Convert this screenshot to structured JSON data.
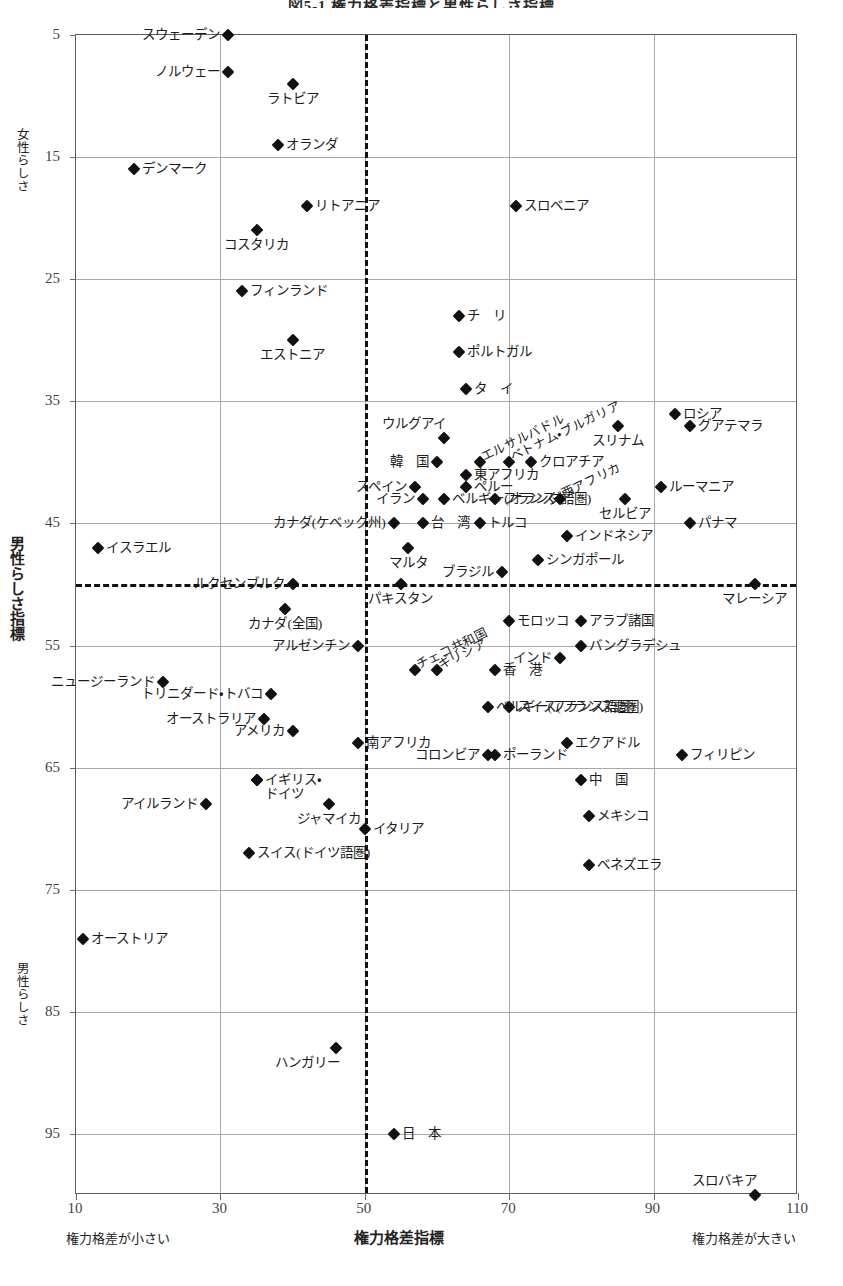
{
  "title": "図5-1 権力格差指標と男性らしさ指標",
  "axes": {
    "y_caption_top": "女性らしさ",
    "y_caption_main": "男性らしさ指標",
    "y_caption_bottom": "男性らしさ",
    "x_caption_left": "権力格差が小さい",
    "x_caption_center": "権力格差指標",
    "x_caption_right": "権力格差が大きい",
    "x_ticks": [
      10,
      30,
      50,
      70,
      90,
      110
    ],
    "y_ticks": [
      5,
      15,
      25,
      35,
      45,
      55,
      65,
      75,
      85,
      95
    ]
  },
  "chart_data": {
    "type": "scatter",
    "title": "図5-1 権力格差指標と男性らしさ指標",
    "xlabel": "権力格差指標",
    "ylabel": "男性らしさ指標",
    "xlim": [
      10,
      110
    ],
    "ylim": [
      5,
      100
    ],
    "y_inverted": true,
    "grid": true,
    "legend": "none",
    "reference_lines": {
      "x": 50,
      "y": 50
    },
    "points": [
      {
        "label": "スウェーデン",
        "x": 31,
        "y": 5,
        "pos": "left"
      },
      {
        "label": "ノルウェー",
        "x": 31,
        "y": 8,
        "pos": "left"
      },
      {
        "label": "ラトビア",
        "x": 40,
        "y": 9,
        "pos": "below"
      },
      {
        "label": "オランダ",
        "x": 38,
        "y": 14,
        "pos": "right"
      },
      {
        "label": "デンマーク",
        "x": 18,
        "y": 16,
        "pos": "right"
      },
      {
        "label": "リトアニア",
        "x": 42,
        "y": 19,
        "pos": "right"
      },
      {
        "label": "スロベニア",
        "x": 71,
        "y": 19,
        "pos": "right"
      },
      {
        "label": "コスタリカ",
        "x": 35,
        "y": 21,
        "pos": "below"
      },
      {
        "label": "フィンランド",
        "x": 33,
        "y": 26,
        "pos": "right"
      },
      {
        "label": "チ　リ",
        "x": 63,
        "y": 28,
        "pos": "right"
      },
      {
        "label": "エストニア",
        "x": 40,
        "y": 30,
        "pos": "below"
      },
      {
        "label": "ポルトガル",
        "x": 63,
        "y": 31,
        "pos": "right"
      },
      {
        "label": "タ　イ",
        "x": 64,
        "y": 34,
        "pos": "right"
      },
      {
        "label": "ロシア",
        "x": 93,
        "y": 36,
        "pos": "right"
      },
      {
        "label": "グアテマラ",
        "x": 95,
        "y": 37,
        "pos": "right"
      },
      {
        "label": "ウルグアイ",
        "x": 61,
        "y": 38,
        "pos": "above-left"
      },
      {
        "label": "スリナム",
        "x": 85,
        "y": 37,
        "pos": "below"
      },
      {
        "label": "エルサルバドル",
        "x": 66,
        "y": 40,
        "pos": "rot"
      },
      {
        "label": "ベトナム・ブルガリア",
        "x": 70,
        "y": 40,
        "pos": "rot"
      },
      {
        "label": "韓　国",
        "x": 60,
        "y": 40,
        "pos": "left"
      },
      {
        "label": "クロアチア",
        "x": 73,
        "y": 40,
        "pos": "right"
      },
      {
        "label": "東アフリカ",
        "x": 64,
        "y": 41,
        "pos": "right"
      },
      {
        "label": "スペイン",
        "x": 57,
        "y": 42,
        "pos": "left"
      },
      {
        "label": "ペルー",
        "x": 64,
        "y": 42,
        "pos": "right"
      },
      {
        "label": "ルーマニア",
        "x": 91,
        "y": 42,
        "pos": "right"
      },
      {
        "label": "イラン",
        "x": 58,
        "y": 43,
        "pos": "left"
      },
      {
        "label": "ベルギー(オランダ語圏)",
        "x": 61,
        "y": 43,
        "pos": "right"
      },
      {
        "label": "フランス",
        "x": 68,
        "y": 43,
        "pos": "right"
      },
      {
        "label": "西アフリカ",
        "x": 77,
        "y": 43,
        "pos": "rot"
      },
      {
        "label": "セルビア",
        "x": 86,
        "y": 43,
        "pos": "below"
      },
      {
        "label": "カナダ(ケベック州)",
        "x": 54,
        "y": 45,
        "pos": "left"
      },
      {
        "label": "台　湾",
        "x": 58,
        "y": 45,
        "pos": "right"
      },
      {
        "label": "トルコ",
        "x": 66,
        "y": 45,
        "pos": "right"
      },
      {
        "label": "インドネシア",
        "x": 78,
        "y": 46,
        "pos": "right"
      },
      {
        "label": "パナマ",
        "x": 95,
        "y": 45,
        "pos": "right"
      },
      {
        "label": "イスラエル",
        "x": 13,
        "y": 47,
        "pos": "right"
      },
      {
        "label": "マルタ",
        "x": 56,
        "y": 47,
        "pos": "below"
      },
      {
        "label": "ブラジル",
        "x": 69,
        "y": 49,
        "pos": "left"
      },
      {
        "label": "シンガポール",
        "x": 74,
        "y": 48,
        "pos": "right"
      },
      {
        "label": "ルクセンブルク",
        "x": 40,
        "y": 50,
        "pos": "left"
      },
      {
        "label": "マレーシア",
        "x": 104,
        "y": 50,
        "pos": "below"
      },
      {
        "label": "パキスタン",
        "x": 55,
        "y": 50,
        "pos": "below"
      },
      {
        "label": "カナダ(全国)",
        "x": 39,
        "y": 52,
        "pos": "below"
      },
      {
        "label": "モロッコ",
        "x": 70,
        "y": 53,
        "pos": "right"
      },
      {
        "label": "アラブ諸国",
        "x": 80,
        "y": 53,
        "pos": "right"
      },
      {
        "label": "アルゼンチン",
        "x": 49,
        "y": 55,
        "pos": "left"
      },
      {
        "label": "チェコ共和国",
        "x": 57,
        "y": 57,
        "pos": "rot"
      },
      {
        "label": "ギリシア",
        "x": 60,
        "y": 57,
        "pos": "rot"
      },
      {
        "label": "インド",
        "x": 77,
        "y": 56,
        "pos": "left"
      },
      {
        "label": "バングラデシュ",
        "x": 80,
        "y": 55,
        "pos": "right"
      },
      {
        "label": "ニュージーランド",
        "x": 22,
        "y": 58,
        "pos": "left"
      },
      {
        "label": "香　港",
        "x": 68,
        "y": 57,
        "pos": "right"
      },
      {
        "label": "トリニダード・トバコ",
        "x": 37,
        "y": 59,
        "pos": "left"
      },
      {
        "label": "スイス(フランス語圏)",
        "x": 70,
        "y": 60,
        "pos": "right"
      },
      {
        "label": "オーストラリア",
        "x": 36,
        "y": 61,
        "pos": "left"
      },
      {
        "label": "アメリカ",
        "x": 40,
        "y": 62,
        "pos": "left"
      },
      {
        "label": "ベルギー(フランス語圏)",
        "x": 67,
        "y": 60,
        "pos": "right"
      },
      {
        "label": "南アフリカ",
        "x": 49,
        "y": 63,
        "pos": "right"
      },
      {
        "label": "エクアドル",
        "x": 78,
        "y": 63,
        "pos": "right"
      },
      {
        "label": "コロンビア",
        "x": 67,
        "y": 64,
        "pos": "left"
      },
      {
        "label": "ポーランド",
        "x": 68,
        "y": 64,
        "pos": "right"
      },
      {
        "label": "フィリピン",
        "x": 94,
        "y": 64,
        "pos": "right"
      },
      {
        "label": "イギリス・",
        "x": 35,
        "y": 66,
        "pos": "right"
      },
      {
        "label": "ドイツ",
        "x": 35,
        "y": 66,
        "pos": "right2"
      },
      {
        "label": "中　国",
        "x": 80,
        "y": 66,
        "pos": "right"
      },
      {
        "label": "アイルランド",
        "x": 28,
        "y": 68,
        "pos": "left"
      },
      {
        "label": "ジャマイカ",
        "x": 45,
        "y": 68,
        "pos": "below"
      },
      {
        "label": "イタリア",
        "x": 50,
        "y": 70,
        "pos": "right"
      },
      {
        "label": "メキシコ",
        "x": 81,
        "y": 69,
        "pos": "right"
      },
      {
        "label": "スイス(ドイツ語圏)",
        "x": 34,
        "y": 72,
        "pos": "right"
      },
      {
        "label": "ベネズエラ",
        "x": 81,
        "y": 73,
        "pos": "right"
      },
      {
        "label": "オーストリア",
        "x": 11,
        "y": 79,
        "pos": "right"
      },
      {
        "label": "ハンガリー",
        "x": 46,
        "y": 88,
        "pos": "below-left"
      },
      {
        "label": "日　本",
        "x": 54,
        "y": 95,
        "pos": "right"
      },
      {
        "label": "スロバキア",
        "x": 104,
        "y": 100,
        "pos": "above-left"
      }
    ]
  }
}
